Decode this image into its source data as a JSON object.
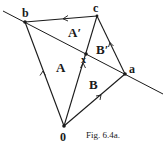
{
  "figure": {
    "caption": "Fig. 6.4a.",
    "points": {
      "b": {
        "label": "b",
        "x": 25,
        "y": 22
      },
      "c": {
        "label": "c",
        "x": 97,
        "y": 16
      },
      "x": {
        "label": "x",
        "x": 86,
        "y": 54
      },
      "a": {
        "label": "a",
        "x": 125,
        "y": 74
      },
      "o": {
        "label": "0",
        "x": 64,
        "y": 126
      }
    },
    "regions": {
      "A": "A",
      "A_prime": "A′",
      "B": "B",
      "B_prime": "B′"
    },
    "line_color": "#1a1a1a",
    "background": "#ffffff"
  }
}
